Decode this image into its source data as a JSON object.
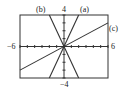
{
  "chart_data": {
    "type": "line",
    "title": "",
    "xlabel": "",
    "ylabel": "",
    "xlim": [
      -6,
      6
    ],
    "ylim": [
      -4,
      4
    ],
    "tick_labels": {
      "xmin": "−6",
      "xmax": "6",
      "ymax": "4",
      "ymin": "−4"
    },
    "grid": false,
    "series": [
      {
        "name": "(a)",
        "equation": "y = 2x",
        "slope": 2,
        "x": [
          -2,
          2
        ],
        "y": [
          -4,
          4
        ]
      },
      {
        "name": "(b)",
        "equation": "y = -2x",
        "slope": -2,
        "x": [
          -2,
          2
        ],
        "y": [
          4,
          -4
        ]
      },
      {
        "name": "(c)",
        "equation": "y = x/2",
        "slope": 0.5,
        "x": [
          -6,
          6
        ],
        "y": [
          -3,
          3
        ]
      }
    ],
    "legend_position": "inline labels"
  }
}
